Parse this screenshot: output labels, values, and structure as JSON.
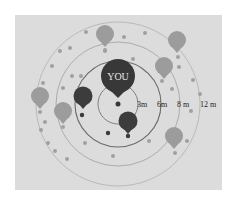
{
  "diagram": {
    "type": "proximity-rings",
    "center_label": "YOU",
    "rings": [
      {
        "label": "3 m",
        "radius": 20
      },
      {
        "label": "6 m",
        "radius": 43
      },
      {
        "label": "8 m",
        "radius": 62
      },
      {
        "label": "12 m",
        "radius": 82
      }
    ],
    "ring_labels": [
      "3m",
      "6m",
      "8 m",
      "12 m"
    ],
    "colors": {
      "panel": "#dcdcdc",
      "dark_balloon": "#3a3a3a",
      "light_balloon": "#9a9a9a",
      "ring_dark": "#666666",
      "ring_light": "#a8a8a8",
      "dot": "#9d9d9d"
    },
    "balloons": [
      {
        "id": "you",
        "x": 118,
        "y": 75,
        "r": 17,
        "shade": "dark"
      },
      {
        "id": "near-left",
        "x": 83,
        "y": 97,
        "r": 10,
        "shade": "dark"
      },
      {
        "id": "near-bottom",
        "x": 128,
        "y": 122,
        "r": 10,
        "shade": "dark"
      },
      {
        "id": "top",
        "x": 105,
        "y": 35,
        "r": 10,
        "shade": "light"
      },
      {
        "id": "top-right",
        "x": 177,
        "y": 41,
        "r": 10,
        "shade": "light"
      },
      {
        "id": "right-upper",
        "x": 164,
        "y": 67,
        "r": 10,
        "shade": "light"
      },
      {
        "id": "left",
        "x": 40,
        "y": 97,
        "r": 10,
        "shade": "light"
      },
      {
        "id": "left-lower",
        "x": 63,
        "y": 112,
        "r": 10,
        "shade": "light"
      },
      {
        "id": "right-lower",
        "x": 174,
        "y": 137,
        "r": 10,
        "shade": "light"
      }
    ]
  }
}
